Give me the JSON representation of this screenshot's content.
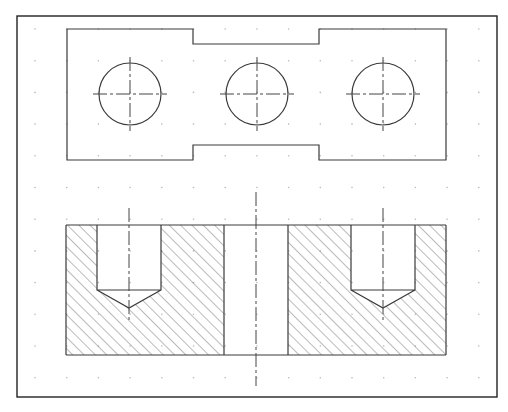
{
  "drawing": {
    "type": "engineering-drawing",
    "frame": {
      "x": 17,
      "y": 16,
      "w": 480,
      "h": 381
    },
    "grid": {
      "spacing": 31.7,
      "color": "#b8b8b8"
    },
    "top_view": {
      "outline": "stepped plate with 3 through holes",
      "holes": [
        {
          "cx": 130,
          "cy": 94,
          "r": 31
        },
        {
          "cx": 257,
          "cy": 94,
          "r": 31
        },
        {
          "cx": 383,
          "cy": 94,
          "r": 31
        }
      ]
    },
    "section_view": {
      "hatch": "45-degree cross hatching",
      "blind_holes": [
        {
          "x1": 97,
          "x2": 161,
          "bottom": 290,
          "tip": 308
        },
        {
          "x1": 351,
          "x2": 415,
          "bottom": 290,
          "tip": 308
        }
      ],
      "through_slot": {
        "x1": 224,
        "x2": 288
      }
    },
    "line_color": "#3a3a3a"
  }
}
